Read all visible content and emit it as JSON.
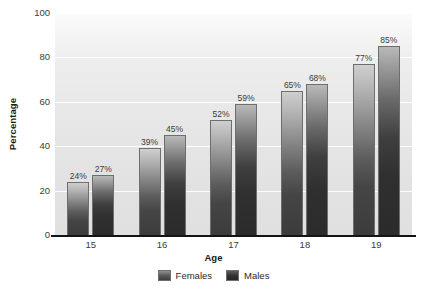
{
  "chart_data": {
    "type": "bar",
    "title": "",
    "xlabel": "Age",
    "ylabel": "Percentage",
    "categories": [
      "15",
      "16",
      "17",
      "18",
      "19"
    ],
    "series": [
      {
        "name": "Females",
        "values": [
          24,
          27,
          39,
          45,
          52
        ]
      },
      {
        "name": "Males",
        "values": [
          27,
          45,
          59,
          68,
          85
        ]
      }
    ],
    "grouped_values": {
      "15": {
        "Females": 24,
        "Males": 27
      },
      "16": {
        "Females": 39,
        "Males": 45
      },
      "17": {
        "Females": 52,
        "Males": 59
      },
      "18": {
        "Females": 65,
        "Males": 68
      },
      "19": {
        "Females": 77,
        "Males": 85
      }
    },
    "data_labels": [
      [
        "24%",
        "27%"
      ],
      [
        "39%",
        "45%"
      ],
      [
        "52%",
        "59%"
      ],
      [
        "65%",
        "68%"
      ],
      [
        "77%",
        "85%"
      ]
    ],
    "ylim": [
      0,
      100
    ],
    "yticks": [
      "0",
      "20",
      "40",
      "60",
      "80",
      "100"
    ],
    "grid": true,
    "legend_position": "bottom-center",
    "colors": {
      "females_top": "#cfcfcf",
      "females_bottom": "#3c3c3c",
      "males_top": "#b9b9b9",
      "males_bottom": "#2b2b2b",
      "gridline": "#ffffff",
      "plot_background": "#e6e6e6",
      "axis": "#141414",
      "label_text": "#3b3b3b"
    }
  },
  "axes": {
    "y_title": "Percentage",
    "x_title": "Age",
    "y_tick_labels": [
      "100",
      "80",
      "60",
      "40",
      "20",
      "0"
    ],
    "x_tick_labels": [
      "15",
      "16",
      "17",
      "18",
      "19"
    ]
  },
  "legend": {
    "items": [
      {
        "label": "Females",
        "key": "females"
      },
      {
        "label": "Males",
        "key": "males"
      }
    ]
  },
  "bars": [
    {
      "group": "15",
      "series": "Females",
      "value": 24,
      "label": "24%"
    },
    {
      "group": "15",
      "series": "Males",
      "value": 27,
      "label": "27%"
    },
    {
      "group": "16",
      "series": "Females",
      "value": 39,
      "label": "39%"
    },
    {
      "group": "16",
      "series": "Males",
      "value": 45,
      "label": "45%"
    },
    {
      "group": "17",
      "series": "Females",
      "value": 52,
      "label": "52%"
    },
    {
      "group": "17",
      "series": "Males",
      "value": 59,
      "label": "59%"
    },
    {
      "group": "18",
      "series": "Females",
      "value": 65,
      "label": "65%"
    },
    {
      "group": "18",
      "series": "Males",
      "value": 68,
      "label": "68%"
    },
    {
      "group": "19",
      "series": "Females",
      "value": 77,
      "label": "77%"
    },
    {
      "group": "19",
      "series": "Males",
      "value": 85,
      "label": "85%"
    }
  ]
}
